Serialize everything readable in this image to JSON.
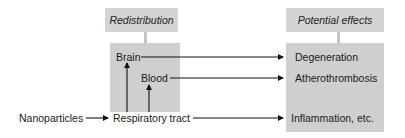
{
  "diagram": {
    "headers": {
      "redistribution": "Redistribution",
      "potential_effects": "Potential effects"
    },
    "nodes": {
      "nanoparticles": "Nanoparticles",
      "respiratory_tract": "Respiratory tract",
      "brain": "Brain",
      "blood": "Blood",
      "degeneration": "Degeneration",
      "atherothrombosis": "Atherothrombosis",
      "inflammation": "Inflammation, etc."
    },
    "edges": [
      {
        "from": "Nanoparticles",
        "to": "Respiratory tract"
      },
      {
        "from": "Respiratory tract",
        "to": "Brain"
      },
      {
        "from": "Respiratory tract",
        "to": "Blood"
      },
      {
        "from": "Brain",
        "to": "Degeneration"
      },
      {
        "from": "Blood",
        "to": "Atherothrombosis"
      },
      {
        "from": "Respiratory tract",
        "to": "Inflammation, etc."
      }
    ],
    "colors": {
      "box_fill": "#cfcfcf",
      "header_fill": "#d4d4d4",
      "line": "#111111"
    }
  }
}
